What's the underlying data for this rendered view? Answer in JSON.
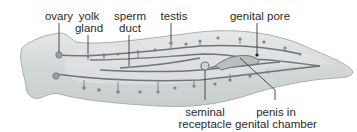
{
  "diagram": {
    "colors": {
      "body_fill": "#d7dbdc",
      "body_edge": "#a9aeaf",
      "duct": "#6f7677",
      "organ": "#8b9192",
      "label_line": "#3a3a3a",
      "text": "#2a2a2a"
    },
    "labels": [
      {
        "id": "ovary",
        "lines": [
          "ovary"
        ]
      },
      {
        "id": "yolk-gland",
        "lines": [
          "yolk",
          "gland"
        ]
      },
      {
        "id": "sperm-duct",
        "lines": [
          "sperm",
          "duct"
        ]
      },
      {
        "id": "testis",
        "lines": [
          "testis"
        ]
      },
      {
        "id": "genital-pore",
        "lines": [
          "genital pore"
        ]
      },
      {
        "id": "seminal-receptacle",
        "lines": [
          "seminal",
          "receptacle"
        ]
      },
      {
        "id": "penis-in-genital-chamber",
        "lines": [
          "penis in",
          "genital chamber"
        ]
      }
    ]
  }
}
